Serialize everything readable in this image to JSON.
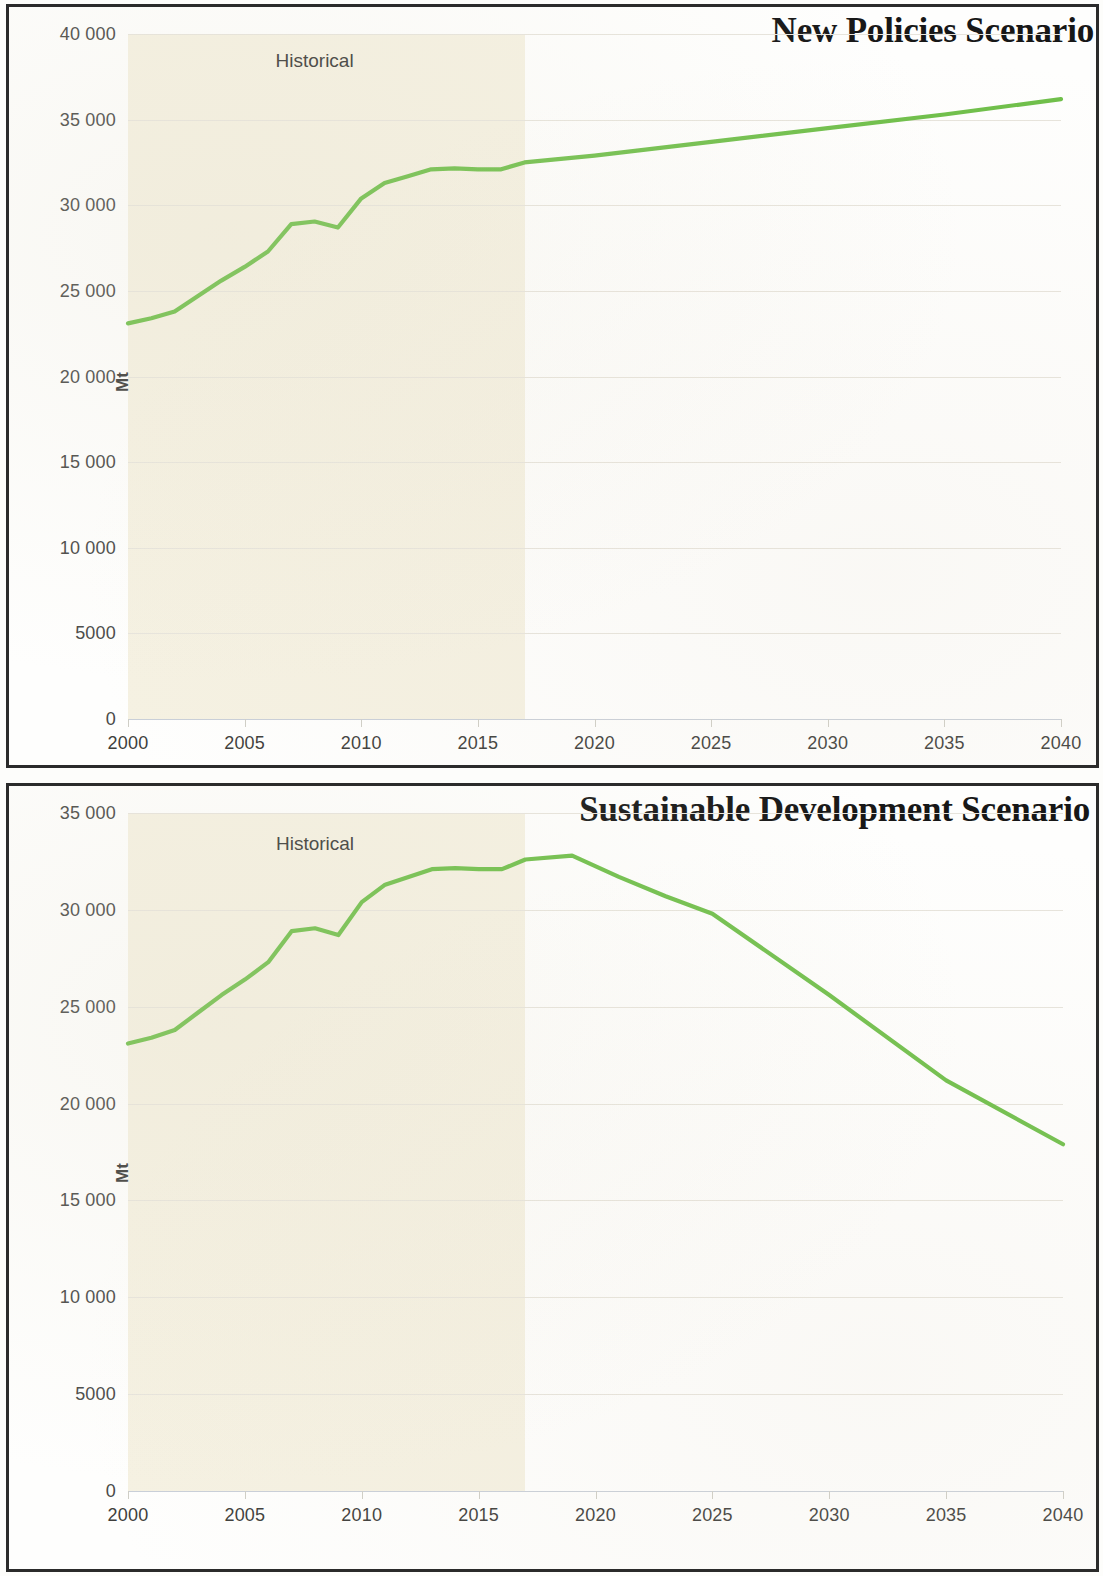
{
  "charts": [
    {
      "id": "new-policies",
      "title": "New Policies Scenario",
      "ylabel": "Mt",
      "hist_note": "Historical",
      "y_ticks": [
        "0",
        "5000",
        "10 000",
        "15 000",
        "20 000",
        "25 000",
        "30 000",
        "35 000",
        "40 000"
      ],
      "x_ticks": [
        "2000",
        "2005",
        "2010",
        "2015",
        "2020",
        "2025",
        "2030",
        "2035",
        "2040"
      ],
      "line_color": "#6fbf4a",
      "hist_band_color": "#f5f1e2"
    },
    {
      "id": "sustainable-development",
      "title": "Sustainable Development Scenario",
      "ylabel": "Mt",
      "hist_note": "Historical",
      "y_ticks": [
        "0",
        "5000",
        "10 000",
        "15 000",
        "20 000",
        "25 000",
        "30 000",
        "35 000"
      ],
      "x_ticks": [
        "2000",
        "2005",
        "2010",
        "2015",
        "2020",
        "2025",
        "2030",
        "2035",
        "2040"
      ],
      "line_color": "#6fbf4a",
      "hist_band_color": "#f5f1e2"
    }
  ],
  "chart_data": [
    {
      "type": "line",
      "title": "New Policies Scenario",
      "xlabel": "",
      "ylabel": "Mt",
      "xlim": [
        2000,
        2040
      ],
      "ylim": [
        0,
        40000
      ],
      "ytick_step": 5000,
      "xtick_step": 5,
      "grid": true,
      "legend": null,
      "annotations": [
        {
          "text": "Historical",
          "x": 2008,
          "note": "label over shaded historical band 2000-2017"
        }
      ],
      "shaded_region": {
        "label": "Historical",
        "x_start": 2000,
        "x_end": 2017,
        "color": "#f5f1e2"
      },
      "series": [
        {
          "name": "CO2 emissions",
          "color": "#6fbf4a",
          "x": [
            2000,
            2001,
            2002,
            2003,
            2004,
            2005,
            2006,
            2007,
            2008,
            2009,
            2010,
            2011,
            2012,
            2013,
            2014,
            2015,
            2016,
            2017,
            2020,
            2025,
            2030,
            2035,
            2040
          ],
          "values": [
            23100,
            23400,
            23800,
            24700,
            25600,
            26400,
            27300,
            28900,
            29050,
            28700,
            30400,
            31300,
            31700,
            32100,
            32150,
            32100,
            32100,
            32500,
            32900,
            33700,
            34500,
            35300,
            36200
          ]
        }
      ]
    },
    {
      "type": "line",
      "title": "Sustainable Development Scenario",
      "xlabel": "",
      "ylabel": "Mt",
      "xlim": [
        2000,
        2040
      ],
      "ylim": [
        0,
        35000
      ],
      "ytick_step": 5000,
      "xtick_step": 5,
      "grid": true,
      "legend": null,
      "annotations": [
        {
          "text": "Historical",
          "x": 2008,
          "note": "label over shaded historical band 2000-2017"
        }
      ],
      "shaded_region": {
        "label": "Historical",
        "x_start": 2000,
        "x_end": 2017,
        "color": "#f5f1e2"
      },
      "series": [
        {
          "name": "CO2 emissions",
          "color": "#6fbf4a",
          "x": [
            2000,
            2001,
            2002,
            2003,
            2004,
            2005,
            2006,
            2007,
            2008,
            2009,
            2010,
            2011,
            2012,
            2013,
            2014,
            2015,
            2016,
            2017,
            2019,
            2021,
            2023,
            2025,
            2030,
            2035,
            2040
          ],
          "values": [
            23100,
            23400,
            23800,
            24700,
            25600,
            26400,
            27300,
            28900,
            29050,
            28700,
            30400,
            31300,
            31700,
            32100,
            32150,
            32100,
            32100,
            32600,
            32800,
            31700,
            30700,
            29800,
            25600,
            21200,
            17900
          ]
        }
      ]
    }
  ]
}
